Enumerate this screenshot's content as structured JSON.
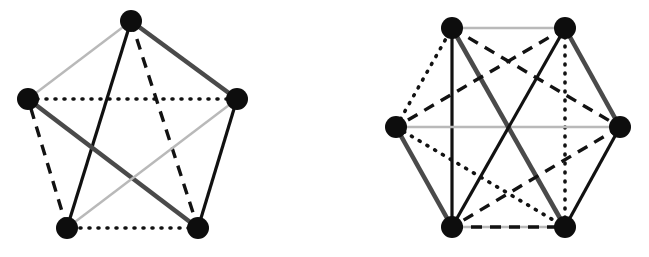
{
  "figure": {
    "background_color": "#ffffff",
    "width": 649,
    "height": 257,
    "vertex_color": "#0d0d0d",
    "vertex_radius": 11,
    "styles": {
      "solid_black": {
        "name": "solid-black",
        "color": "#111111",
        "width": 3.2,
        "dash": "none"
      },
      "thick_gray": {
        "name": "thick-dark-gray",
        "color": "#4a4a4a",
        "width": 4.6,
        "dash": "none"
      },
      "light_gray": {
        "name": "light-gray",
        "color": "#b9b9b9",
        "width": 2.4,
        "dash": "none"
      },
      "dashed": {
        "name": "dashed-black",
        "color": "#121212",
        "width": 3.4,
        "dash": "11,8"
      },
      "dotted": {
        "name": "dotted-black",
        "color": "#121212",
        "width": 3.6,
        "dash": "1,8"
      }
    }
  },
  "graphs": [
    {
      "id": "left-graph",
      "name": "pentagon-k5",
      "label": "K5 pentagon",
      "vertices": [
        {
          "id": "v0",
          "name": "vertex-top",
          "x": 131,
          "y": 21
        },
        {
          "id": "v1",
          "name": "vertex-right",
          "x": 237,
          "y": 99
        },
        {
          "id": "v2",
          "name": "vertex-bottom-right",
          "x": 198,
          "y": 228
        },
        {
          "id": "v3",
          "name": "vertex-bottom-left",
          "x": 67,
          "y": 228
        },
        {
          "id": "v4",
          "name": "vertex-left",
          "x": 28,
          "y": 99
        }
      ],
      "edges": [
        {
          "name": "edge-top-right",
          "from": "v0",
          "to": "v1",
          "style": "thick_gray"
        },
        {
          "name": "edge-right-bottomright",
          "from": "v1",
          "to": "v2",
          "style": "solid_black"
        },
        {
          "name": "edge-bottom",
          "from": "v2",
          "to": "v3",
          "style": "dotted"
        },
        {
          "name": "edge-bottomleft-left",
          "from": "v3",
          "to": "v4",
          "style": "dashed"
        },
        {
          "name": "edge-left-top",
          "from": "v4",
          "to": "v0",
          "style": "light_gray"
        },
        {
          "name": "edge-top-bottomleft",
          "from": "v0",
          "to": "v3",
          "style": "solid_black"
        },
        {
          "name": "edge-top-bottomright",
          "from": "v0",
          "to": "v2",
          "style": "dashed"
        },
        {
          "name": "edge-left-bottomright",
          "from": "v4",
          "to": "v2",
          "style": "thick_gray"
        },
        {
          "name": "edge-left-right",
          "from": "v4",
          "to": "v1",
          "style": "dotted"
        },
        {
          "name": "edge-right-bottomleft",
          "from": "v1",
          "to": "v3",
          "style": "light_gray"
        }
      ]
    },
    {
      "id": "right-graph",
      "name": "hexagon-k6",
      "label": "K6 hexagon",
      "vertices": [
        {
          "id": "w0",
          "name": "vertex-top-left",
          "x": 452,
          "y": 28
        },
        {
          "id": "w1",
          "name": "vertex-top-right",
          "x": 565,
          "y": 28
        },
        {
          "id": "w2",
          "name": "vertex-right",
          "x": 620,
          "y": 127
        },
        {
          "id": "w3",
          "name": "vertex-bottom-right",
          "x": 565,
          "y": 227
        },
        {
          "id": "w4",
          "name": "vertex-bottom-left",
          "x": 452,
          "y": 227
        },
        {
          "id": "w5",
          "name": "vertex-left",
          "x": 396,
          "y": 127
        }
      ],
      "edges": [
        {
          "name": "edge-top",
          "from": "w0",
          "to": "w1",
          "style": "light_gray"
        },
        {
          "name": "edge-topright-right",
          "from": "w1",
          "to": "w2",
          "style": "thick_gray"
        },
        {
          "name": "edge-right-bottomright",
          "from": "w2",
          "to": "w3",
          "style": "solid_black"
        },
        {
          "name": "edge-bottom",
          "from": "w3",
          "to": "w4",
          "style": "light_gray"
        },
        {
          "name": "edge-bottomleft-left",
          "from": "w4",
          "to": "w5",
          "style": "thick_gray"
        },
        {
          "name": "edge-left-topleft",
          "from": "w5",
          "to": "w0",
          "style": "dotted"
        },
        {
          "name": "edge-topleft-bottomleft",
          "from": "w0",
          "to": "w4",
          "style": "solid_black"
        },
        {
          "name": "edge-topright-bottomright",
          "from": "w1",
          "to": "w3",
          "style": "dotted"
        },
        {
          "name": "edge-left-right",
          "from": "w5",
          "to": "w2",
          "style": "light_gray"
        },
        {
          "name": "edge-topleft-bottomright",
          "from": "w0",
          "to": "w3",
          "style": "thick_gray"
        },
        {
          "name": "edge-topright-bottomleft",
          "from": "w1",
          "to": "w4",
          "style": "solid_black"
        },
        {
          "name": "edge-topleft-right",
          "from": "w0",
          "to": "w2",
          "style": "dashed"
        },
        {
          "name": "edge-topright-left",
          "from": "w1",
          "to": "w5",
          "style": "dashed"
        },
        {
          "name": "edge-left-bottomright",
          "from": "w5",
          "to": "w3",
          "style": "dotted"
        },
        {
          "name": "edge-right-bottomleft",
          "from": "w2",
          "to": "w4",
          "style": "dashed"
        },
        {
          "name": "edge-bottomleft-bottomright",
          "from": "w4",
          "to": "w3",
          "style": "dashed"
        }
      ]
    }
  ]
}
